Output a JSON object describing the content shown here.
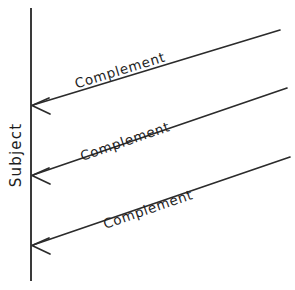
{
  "diagram": {
    "type": "sequence-diagram",
    "background_color": "#ffffff",
    "line_color": "#2b2b2b",
    "text_color": "#1e1e1e",
    "lifeline": {
      "label": "Subject",
      "orientation": "vertical",
      "label_rotation_deg": -90,
      "x": 31,
      "y_top": 8,
      "y_bottom": 281,
      "label_x": 16,
      "label_y": 155
    },
    "messages": [
      {
        "label": "Complement",
        "direction": "right-to-left",
        "from_x": 280,
        "from_y": 30,
        "to_x": 33,
        "to_y": 105,
        "label_x": 120,
        "label_y": 70,
        "label_rotation_deg": -17
      },
      {
        "label": "Complement",
        "direction": "right-to-left",
        "from_x": 287,
        "from_y": 88,
        "to_x": 33,
        "to_y": 175,
        "label_x": 125,
        "label_y": 141,
        "label_rotation_deg": -19
      },
      {
        "label": "Complement",
        "direction": "right-to-left",
        "from_x": 290,
        "from_y": 157,
        "to_x": 33,
        "to_y": 245,
        "label_x": 148,
        "label_y": 209,
        "label_rotation_deg": -19
      }
    ]
  }
}
